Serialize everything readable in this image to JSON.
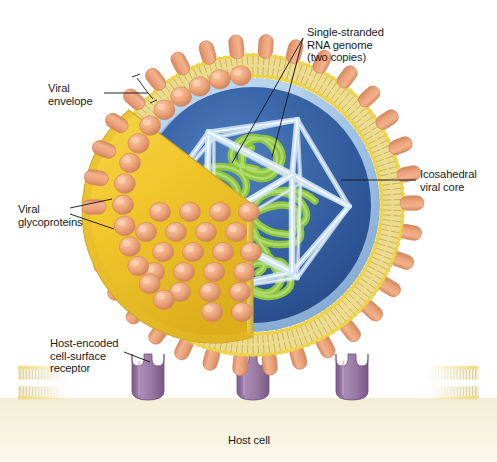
{
  "figure": {
    "type": "biological-structure-diagram",
    "canvas": {
      "width": 497,
      "height": 462
    },
    "background_color": "#ffffff"
  },
  "labels": {
    "viral_envelope": "Viral\nenvelope",
    "viral_glycoproteins": "Viral\nglycoproteins",
    "host_receptor": "Host-encoded\ncell-surface\nreceptor",
    "rna_genome": "Single-stranded\nRNA genome\n(two copies)",
    "icosahedral_core": "Icosahedral\nviral core",
    "host_cell": "Host cell"
  },
  "structures": {
    "virion": {
      "name": "virus particle",
      "center_x": 253,
      "center_y": 205,
      "radius": 148,
      "envelope_color": "#e8d24a",
      "interior_color": "#2e5899",
      "interior_rim_color": "#9fc3e8"
    },
    "glycoprotein_spikes": {
      "name": "envelope glycoprotein spikes",
      "color": "#eda47c",
      "count": 34
    },
    "lipid_bilayer": {
      "name": "viral lipid bilayer",
      "head_color": "#f2d23c",
      "tail_color": "#cbb66a"
    },
    "cutaway_wedge": {
      "name": "cutaway envelope wedge",
      "face_color": "#f0c82d",
      "knob_color": "#eda47c",
      "knob_count": 29
    },
    "icosahedral_core": {
      "name": "icosahedral capsid wireframe",
      "color": "#cfe6f7",
      "edge_highlight": "#ffffff"
    },
    "rna_genome": {
      "name": "single-stranded RNA strands",
      "color": "#8cc63f",
      "copies": 2
    },
    "host_membrane": {
      "name": "host cell plasma membrane",
      "head_color": "#efd75e",
      "tail_color": "#c9b888",
      "cytoplasm_color": "#f2ecd0"
    },
    "receptors": {
      "name": "host-encoded cell-surface receptors",
      "color": "#9b7aa8",
      "count": 3,
      "positions_x": [
        148,
        253,
        352
      ]
    }
  },
  "colors": {
    "text": "#1a1a1a",
    "leader_line": "#1a1a1a"
  }
}
